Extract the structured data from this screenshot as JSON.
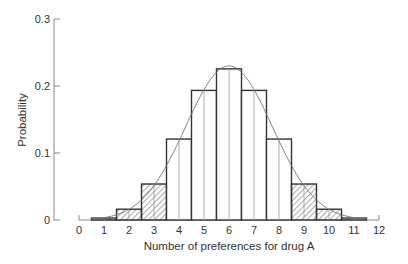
{
  "chart_data": {
    "type": "bar",
    "title": "",
    "xlabel": "Number of preferences for drug A",
    "ylabel": "Probability",
    "categories": [
      0,
      1,
      2,
      3,
      4,
      5,
      6,
      7,
      8,
      9,
      10,
      11,
      12
    ],
    "values": [
      0.0002,
      0.0029,
      0.0161,
      0.0537,
      0.1208,
      0.1934,
      0.2256,
      0.1934,
      0.1208,
      0.0537,
      0.0161,
      0.0029,
      0.0002
    ],
    "hatched": [
      false,
      true,
      true,
      true,
      false,
      false,
      false,
      false,
      false,
      true,
      true,
      true,
      false
    ],
    "overlay_curve": {
      "type": "normal",
      "mean": 6,
      "sd": 1.732,
      "peak": 0.23
    },
    "xlim": [
      0,
      12
    ],
    "ylim": [
      0,
      0.3
    ],
    "xticks": [
      "0",
      "1",
      "2",
      "3",
      "4",
      "5",
      "6",
      "7",
      "8",
      "9",
      "10",
      "11",
      "12"
    ],
    "yticks": [
      "0",
      "0.1",
      "0.2",
      "0.3"
    ],
    "grid": false,
    "legend": null
  },
  "colors": {
    "axis": "#888888",
    "bar_stroke": "#333333",
    "curve": "#777777",
    "text": "#333333"
  }
}
